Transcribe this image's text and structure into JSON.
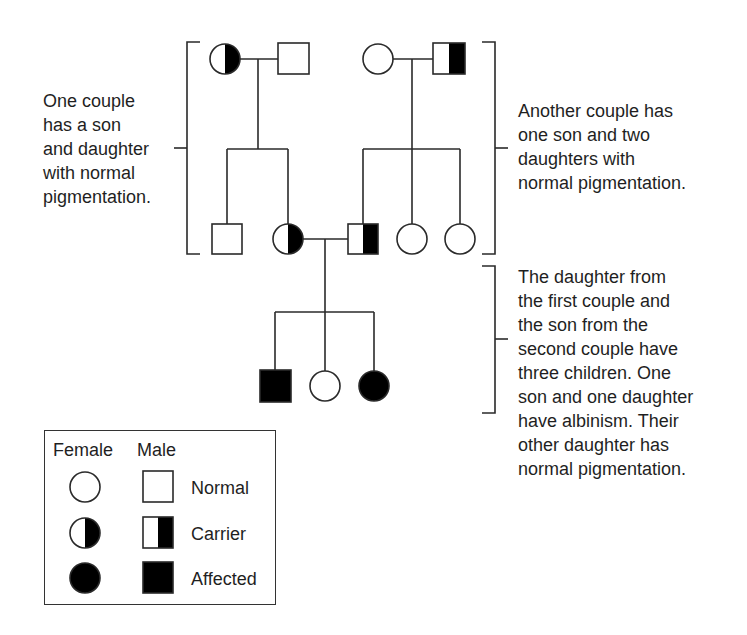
{
  "annotations": {
    "left": "One couple\nhas a son\nand daughter\nwith normal\npigmentation.",
    "right_top": "Another couple has\none son and two\ndaughters with\nnormal pigmentation.",
    "right_bottom": "The daughter from\nthe first couple and\nthe son from the\nsecond couple have\nthree children. One\nson and one daughter\nhave albinism. Their\nother daughter has\nnormal pigmentation."
  },
  "pedigree": {
    "generation_1": [
      {
        "sex": "female",
        "status": "carrier",
        "couple": 1
      },
      {
        "sex": "male",
        "status": "normal",
        "couple": 1
      },
      {
        "sex": "female",
        "status": "normal",
        "couple": 2
      },
      {
        "sex": "male",
        "status": "carrier",
        "couple": 2
      }
    ],
    "generation_2": [
      {
        "sex": "male",
        "status": "normal",
        "parents": 1
      },
      {
        "sex": "female",
        "status": "carrier",
        "parents": 1
      },
      {
        "sex": "male",
        "status": "carrier",
        "parents": 2
      },
      {
        "sex": "female",
        "status": "normal",
        "parents": 2
      },
      {
        "sex": "female",
        "status": "normal",
        "parents": 2
      }
    ],
    "generation_3": [
      {
        "sex": "male",
        "status": "affected"
      },
      {
        "sex": "female",
        "status": "normal"
      },
      {
        "sex": "female",
        "status": "affected"
      }
    ]
  },
  "legend": {
    "col_female": "Female",
    "col_male": "Male",
    "rows": [
      {
        "label": "Normal",
        "female_icon": "open-circle-icon",
        "male_icon": "open-square-icon"
      },
      {
        "label": "Carrier",
        "female_icon": "half-filled-circle-icon",
        "male_icon": "half-filled-square-icon"
      },
      {
        "label": "Affected",
        "female_icon": "filled-circle-icon",
        "male_icon": "filled-square-icon"
      }
    ]
  },
  "colors": {
    "line": "#2a2a2a",
    "fill": "#000000",
    "background": "#ffffff"
  }
}
